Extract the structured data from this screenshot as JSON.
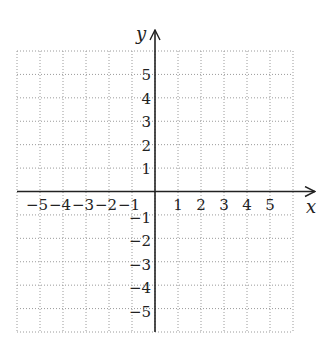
{
  "chart_data": {
    "type": "scatter",
    "title": "",
    "xlabel": "x",
    "ylabel": "y",
    "xlim": [
      -6,
      6
    ],
    "ylim": [
      -6,
      6
    ],
    "grid": true,
    "grid_style": "dotted",
    "x_ticks": [
      -5,
      -4,
      -3,
      -2,
      -1,
      1,
      2,
      3,
      4,
      5
    ],
    "y_ticks": [
      -5,
      -4,
      -3,
      -2,
      -1,
      1,
      2,
      3,
      4,
      5
    ],
    "x_tick_labels": [
      "−5",
      "−4",
      "−3",
      "−2",
      "−1",
      "1",
      "2",
      "3",
      "4",
      "5"
    ],
    "y_tick_labels": [
      "−5",
      "−4",
      "−3",
      "−2",
      "−1",
      "1",
      "2",
      "3",
      "4",
      "5"
    ],
    "series": [],
    "legend": null
  },
  "colors": {
    "axis": "#222222",
    "grid": "#9a9a9a",
    "background": "#ffffff"
  }
}
